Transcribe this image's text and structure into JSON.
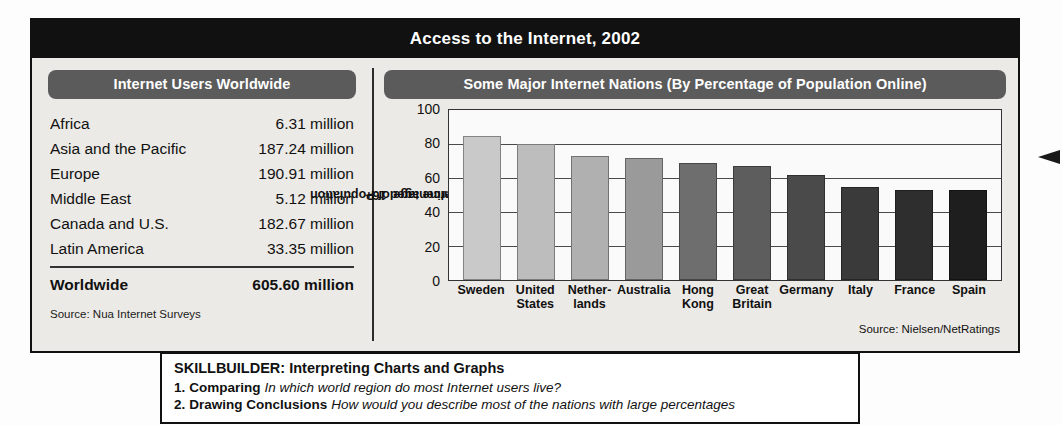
{
  "feature": {
    "title": "Access to the Internet, 2002",
    "left_panel": {
      "heading": "Internet Users Worldwide",
      "rows": [
        {
          "region": "Africa",
          "value": "6.31 million"
        },
        {
          "region": "Asia and the Pacific",
          "value": "187.24 million"
        },
        {
          "region": "Europe",
          "value": "190.91 million"
        },
        {
          "region": "Middle East",
          "value": "5.12 million"
        },
        {
          "region": "Canada and U.S.",
          "value": "182.67 million"
        },
        {
          "region": "Latin America",
          "value": "33.35 million"
        }
      ],
      "total_label": "Worldwide",
      "total_value": "605.60 million",
      "source": "Source: Nua Internet Surveys"
    },
    "right_panel": {
      "heading": "Some Major Internet Nations (By Percentage of Population Online)",
      "source": "Source: Nielsen/NetRatings"
    }
  },
  "chart_data": {
    "type": "bar",
    "title": "Some Major Internet Nations (By Percentage of Population Online)",
    "categories": [
      "Sweden",
      "United States",
      "Netherlands",
      "Australia",
      "Hong Kong",
      "Great Britain",
      "Germany",
      "Italy",
      "France",
      "Spain"
    ],
    "category_lines": [
      [
        "Sweden"
      ],
      [
        "United",
        "States"
      ],
      [
        "Nether-",
        "lands"
      ],
      [
        "Australia"
      ],
      [
        "Hong",
        "Kong"
      ],
      [
        "Great",
        "Britain"
      ],
      [
        "Germany"
      ],
      [
        "Italy"
      ],
      [
        "France"
      ],
      [
        "Spain"
      ]
    ],
    "values": [
      85,
      80,
      73,
      72,
      69,
      67,
      62,
      55,
      53,
      53
    ],
    "bar_colors": [
      "#c9c9c9",
      "#bdbdbd",
      "#b0b0b0",
      "#9a9a9a",
      "#6e6e6e",
      "#5d5d5d",
      "#4a4a4a",
      "#3a3a3a",
      "#2e2e2e",
      "#1e1e1e"
    ],
    "xlabel": "",
    "ylabel": "Percentage of Population Online aged 16+",
    "ylabel_lines": [
      "Percentage of Population",
      "Online aged 16+"
    ],
    "yticks": [
      0,
      20,
      40,
      60,
      80,
      100
    ],
    "ylim": [
      0,
      100
    ],
    "grid": true,
    "legend": "none",
    "source": "Source: Nielsen/NetRatings"
  },
  "skillbuilder": {
    "title": "SKILLBUILDER: Interpreting Charts and Graphs",
    "items": [
      {
        "num": "1.",
        "lead": "Comparing",
        "question": "In which world region do most Internet users live?"
      },
      {
        "num": "2.",
        "lead": "Drawing Conclusions",
        "question": "How would you describe most of the nations with large percentages"
      }
    ]
  }
}
